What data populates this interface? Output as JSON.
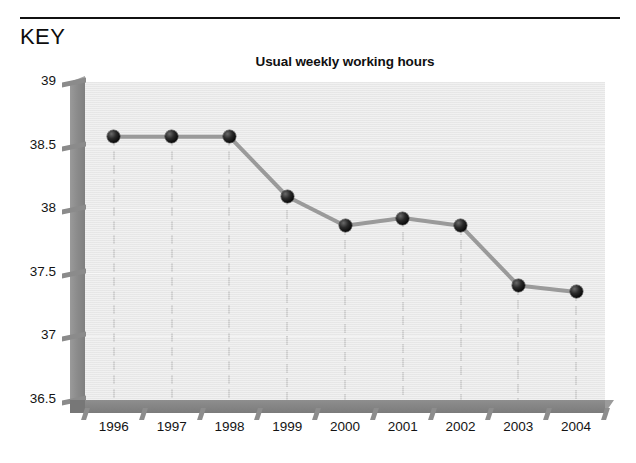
{
  "header": {
    "key_label": "KEY"
  },
  "chart_data": {
    "type": "line",
    "title": "Usual weekly working hours",
    "xlabel": "",
    "ylabel": "",
    "categories": [
      "1996",
      "1997",
      "1998",
      "1999",
      "2000",
      "2001",
      "2002",
      "2003",
      "2004"
    ],
    "values": [
      38.57,
      38.57,
      38.57,
      38.1,
      37.87,
      37.93,
      37.87,
      37.4,
      37.35
    ],
    "series": [
      {
        "name": "Usual weekly working hours",
        "values": [
          38.57,
          38.57,
          38.57,
          38.1,
          37.87,
          37.93,
          37.87,
          37.4,
          37.35
        ]
      }
    ],
    "ylim": [
      36.5,
      39
    ],
    "yticks": [
      39,
      38.5,
      38,
      37.5,
      37,
      36.5
    ],
    "ytick_labels": [
      "39",
      "38.5",
      "38",
      "37.5",
      "37",
      "36.5"
    ],
    "grid": "vertical-dashed",
    "legend": "none",
    "colors": {
      "plot_background": "#e9e9e9",
      "line": "#9a9a9a",
      "marker": "#0b0b0b",
      "axis": "#878787",
      "gridline": "#cfcfcf",
      "text": "#141414"
    }
  }
}
